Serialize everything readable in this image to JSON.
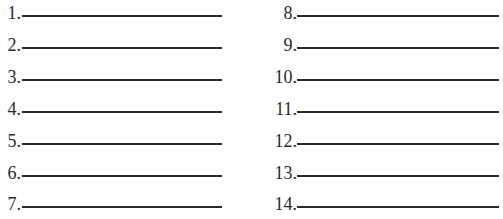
{
  "worksheet": {
    "left_items": [
      {
        "number": "1.",
        "answer": ""
      },
      {
        "number": "2.",
        "answer": ""
      },
      {
        "number": "3.",
        "answer": ""
      },
      {
        "number": "4.",
        "answer": ""
      },
      {
        "number": "5.",
        "answer": ""
      },
      {
        "number": "6.",
        "answer": ""
      },
      {
        "number": "7.",
        "answer": ""
      }
    ],
    "right_items": [
      {
        "number": "8.",
        "answer": ""
      },
      {
        "number": "9.",
        "answer": ""
      },
      {
        "number": "10.",
        "answer": ""
      },
      {
        "number": "11.",
        "answer": ""
      },
      {
        "number": "12.",
        "answer": ""
      },
      {
        "number": "13.",
        "answer": ""
      },
      {
        "number": "14.",
        "answer": ""
      }
    ]
  }
}
